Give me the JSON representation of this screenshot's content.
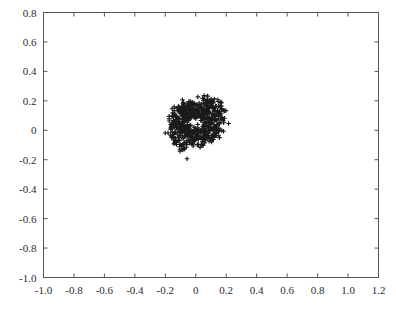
{
  "chart_data": {
    "type": "scatter",
    "title": "",
    "subtitle": "",
    "xlabel": "",
    "ylabel": "",
    "xlim": [
      -1.0,
      1.2
    ],
    "ylim": [
      -1.0,
      0.8
    ],
    "xticks": [
      -1.0,
      -0.8,
      -0.6,
      -0.4,
      -0.2,
      0,
      0.2,
      0.4,
      0.6,
      0.8,
      1.0,
      1.2
    ],
    "xtick_labels": [
      "-1.0",
      "-0.8",
      "-0.6",
      "-0.4",
      "-0.2",
      "0",
      "0.2",
      "0.4",
      "0.6",
      "0.8",
      "1.0",
      "1.2"
    ],
    "yticks": [
      0.8,
      0.6,
      0.4,
      0.2,
      0,
      -0.2,
      -0.4,
      -0.6,
      -0.8,
      -1.0
    ],
    "ytick_labels": [
      "0.8",
      "0.6",
      "0.4",
      "0.2",
      "0",
      "-0.2",
      "-0.4",
      "-0.6",
      "-0.8",
      "-1.0"
    ],
    "grid": false,
    "legend": null,
    "legend_position": "none",
    "marker": "plus",
    "marker_color": "#1a1a1a",
    "marker_size": 3.4,
    "frame": true,
    "tick_direction": "in",
    "annotations": [],
    "generator": {
      "model": "two_arm_log_spiral",
      "center": [
        0.0,
        0.05
      ],
      "arms": 2,
      "arm_phase_offset_deg": 180,
      "t_start_deg": 10,
      "t_end_deg": 430,
      "r_start": 0.06,
      "r_growth_per_turn": 2.62,
      "radial_noise": 0.045,
      "angular_noise_deg": 5.5,
      "points_per_arm": 330,
      "total_points": 660,
      "seed": 20240517
    },
    "series": [
      {
        "name": "arm-1",
        "marker": "plus",
        "color": "#1a1a1a",
        "n_points": 330
      },
      {
        "name": "arm-2",
        "marker": "plus",
        "color": "#1a1a1a",
        "n_points": 330
      }
    ]
  },
  "axes": {
    "frame_color": "#555555",
    "tick_color": "#555555",
    "label_color": "#2b2b2b",
    "background": "#ffffff"
  }
}
